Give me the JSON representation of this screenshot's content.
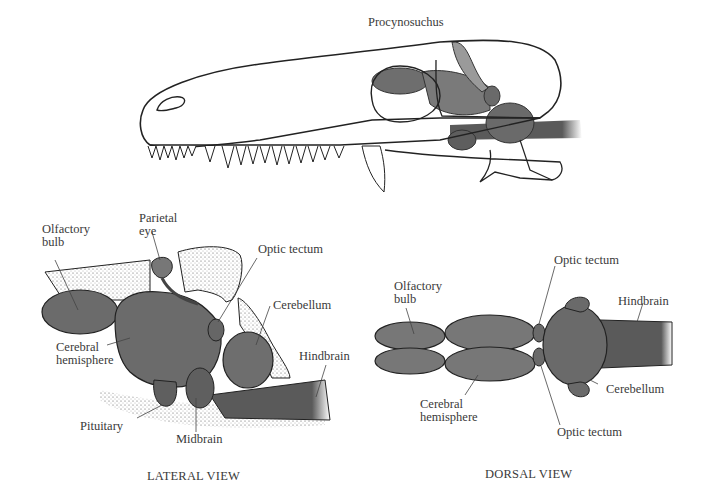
{
  "figure": {
    "title": "Procynosuchus",
    "lateral": {
      "caption": "LATERAL VIEW",
      "labels": {
        "olfactory_bulb": "Olfactory\nbulb",
        "parietal_eye": "Parietal\neye",
        "optic_tectum": "Optic tectum",
        "cerebellum": "Cerebellum",
        "cerebral_hemisphere": "Cerebral\nhemisphere",
        "hindbrain": "Hindbrain",
        "pituitary": "Pituitary",
        "midbrain": "Midbrain"
      }
    },
    "dorsal": {
      "caption": "DORSAL VIEW",
      "labels": {
        "olfactory_bulb": "Olfactory\nbulb",
        "optic_tectum_top": "Optic tectum",
        "hindbrain": "Hindbrain",
        "cerebellum": "Cerebellum",
        "cerebral_hemisphere": "Cerebral\nhemisphere",
        "optic_tectum_bottom": "Optic tectum"
      }
    }
  }
}
